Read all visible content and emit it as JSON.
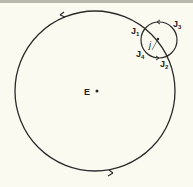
{
  "diagram": {
    "center_label": "E",
    "epicycle_center_label": "j",
    "points": [
      {
        "label": "J",
        "sub": "1"
      },
      {
        "label": "J",
        "sub": "2"
      },
      {
        "label": "J",
        "sub": "3"
      },
      {
        "label": "J",
        "sub": "4"
      }
    ],
    "colors": {
      "background": "#fbfaf0",
      "stroke": "#2a2a2a"
    }
  }
}
